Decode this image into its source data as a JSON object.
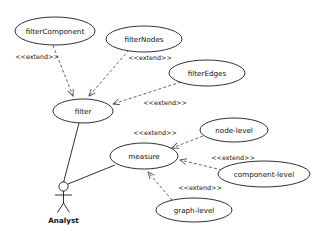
{
  "diagram": {
    "type": "uml-use-case-diagram",
    "background_color": "#ffffff",
    "stroke_color": "#1a1a1a",
    "dashed_stroke_color": "#555555",
    "actor": {
      "name": "Analyst",
      "label": "Analyst"
    },
    "use_cases": [
      {
        "id": "filterComponent",
        "label": "filterComponent",
        "cx": 55,
        "cy": 31,
        "rx": 40,
        "ry": 14
      },
      {
        "id": "filterNodes",
        "label": "filterNodes",
        "cx": 144,
        "cy": 39,
        "rx": 38,
        "ry": 13
      },
      {
        "id": "filterEdges",
        "label": "filterEdges",
        "cx": 207,
        "cy": 73,
        "rx": 38,
        "ry": 13
      },
      {
        "id": "filter",
        "label": "filter",
        "cx": 83,
        "cy": 111,
        "rx": 30,
        "ry": 12
      },
      {
        "id": "measure",
        "label": "measure",
        "cx": 144,
        "cy": 156,
        "rx": 34,
        "ry": 13
      },
      {
        "id": "node-level",
        "label": "node-level",
        "cx": 234,
        "cy": 130,
        "rx": 34,
        "ry": 12
      },
      {
        "id": "component-level",
        "label": "component-level",
        "cx": 264,
        "cy": 174,
        "rx": 46,
        "ry": 13
      },
      {
        "id": "graph-level",
        "label": "graph-level",
        "cx": 194,
        "cy": 210,
        "rx": 38,
        "ry": 12
      }
    ],
    "extend_relations": [
      {
        "from": "filterComponent",
        "to": "filter",
        "label": "<<extend>>",
        "label_x": 37,
        "label_y": 57
      },
      {
        "from": "filterNodes",
        "to": "filter",
        "label": "<<extend>>",
        "label_x": 150,
        "label_y": 58
      },
      {
        "from": "filterEdges",
        "to": "filter",
        "label": "<<extend>>",
        "label_x": 165,
        "label_y": 103
      },
      {
        "from": "node-level",
        "to": "measure",
        "label": "<<extend>>",
        "label_x": 155,
        "label_y": 133
      },
      {
        "from": "component-level",
        "to": "measure",
        "label": "<<extend>>",
        "label_x": 233,
        "label_y": 158
      },
      {
        "from": "graph-level",
        "to": "measure",
        "label": "<<extend>>",
        "label_x": 200,
        "label_y": 188
      }
    ],
    "associations": [
      {
        "from": "Analyst",
        "to": "filter"
      },
      {
        "from": "Analyst",
        "to": "measure"
      }
    ]
  }
}
